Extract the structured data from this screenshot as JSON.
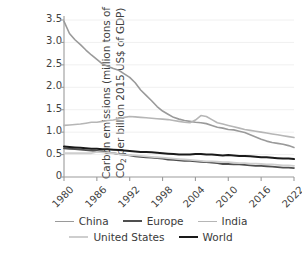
{
  "chart_data": {
    "type": "line",
    "title": "",
    "xlabel": "",
    "ylabel_line1": "Carbon emissions (million tons of",
    "ylabel_line2_a": "CO",
    "ylabel_line2_sub": "2",
    "ylabel_line2_b": " per billion 2015 US$ of GDP)",
    "ylabel_full": "Carbon emissions (million tons of CO2 per billion 2015 US$ of GDP)",
    "xlim": [
      1980,
      2022
    ],
    "ylim": [
      0,
      3.5
    ],
    "ytick_labels": [
      "3.5",
      "3.0",
      "2.5",
      "2.0",
      "1.5",
      "1.0",
      "0.5",
      "0"
    ],
    "ytick_values": [
      3.5,
      3.0,
      2.5,
      2.0,
      1.5,
      1.0,
      0.5,
      0
    ],
    "xtick_labels": [
      "1980",
      "1986",
      "1992",
      "1998",
      "2004",
      "2010",
      "2016",
      "2022"
    ],
    "xtick_values": [
      1980,
      1986,
      1992,
      1998,
      2004,
      2010,
      2016,
      2022
    ],
    "xtick_rotation": -45,
    "grid": "horizontal-light",
    "legend_position": "bottom",
    "x": [
      1980,
      1981,
      1982,
      1983,
      1984,
      1985,
      1986,
      1987,
      1988,
      1989,
      1990,
      1991,
      1992,
      1993,
      1994,
      1995,
      1996,
      1997,
      1998,
      1999,
      2000,
      2001,
      2002,
      2003,
      2004,
      2005,
      2006,
      2007,
      2008,
      2009,
      2010,
      2011,
      2012,
      2013,
      2014,
      2015,
      2016,
      2017,
      2018,
      2019,
      2020,
      2021,
      2022
    ],
    "series": [
      {
        "name": "China",
        "color": "#9a9a9a",
        "width": 1.6,
        "values": [
          3.47,
          3.2,
          3.06,
          2.95,
          2.83,
          2.72,
          2.62,
          2.52,
          2.47,
          2.42,
          2.38,
          2.3,
          2.22,
          2.1,
          1.94,
          1.82,
          1.7,
          1.57,
          1.47,
          1.4,
          1.33,
          1.29,
          1.26,
          1.24,
          1.22,
          1.21,
          1.19,
          1.15,
          1.11,
          1.09,
          1.06,
          1.05,
          1.02,
          0.99,
          0.94,
          0.89,
          0.84,
          0.8,
          0.77,
          0.75,
          0.73,
          0.7,
          0.66
        ]
      },
      {
        "name": "Europe",
        "color": "#4f4f4f",
        "width": 1.8,
        "values": [
          0.64,
          0.63,
          0.62,
          0.61,
          0.6,
          0.59,
          0.58,
          0.57,
          0.55,
          0.53,
          0.51,
          0.5,
          0.48,
          0.46,
          0.45,
          0.44,
          0.43,
          0.42,
          0.41,
          0.39,
          0.38,
          0.37,
          0.36,
          0.36,
          0.35,
          0.34,
          0.33,
          0.32,
          0.31,
          0.29,
          0.29,
          0.28,
          0.28,
          0.27,
          0.26,
          0.25,
          0.25,
          0.24,
          0.23,
          0.22,
          0.21,
          0.21,
          0.2
        ]
      },
      {
        "name": "India",
        "color": "#b6b6b6",
        "width": 1.6,
        "values": [
          1.15,
          1.16,
          1.17,
          1.18,
          1.2,
          1.22,
          1.22,
          1.24,
          1.26,
          1.27,
          1.3,
          1.33,
          1.35,
          1.34,
          1.33,
          1.32,
          1.31,
          1.3,
          1.29,
          1.28,
          1.26,
          1.24,
          1.22,
          1.21,
          1.27,
          1.37,
          1.35,
          1.28,
          1.21,
          1.18,
          1.15,
          1.12,
          1.09,
          1.06,
          1.04,
          1.02,
          1.0,
          0.98,
          0.96,
          0.94,
          0.92,
          0.9,
          0.88
        ]
      },
      {
        "name": "United States",
        "color": "#cecece",
        "width": 1.8,
        "values": [
          0.53,
          0.53,
          0.53,
          0.53,
          0.53,
          0.53,
          0.56,
          0.55,
          0.54,
          0.53,
          0.51,
          0.5,
          0.49,
          0.48,
          0.47,
          0.46,
          0.45,
          0.44,
          0.43,
          0.42,
          0.41,
          0.4,
          0.39,
          0.38,
          0.37,
          0.36,
          0.35,
          0.35,
          0.34,
          0.33,
          0.33,
          0.32,
          0.31,
          0.31,
          0.3,
          0.3,
          0.29,
          0.28,
          0.28,
          0.27,
          0.26,
          0.26,
          0.25
        ]
      },
      {
        "name": "World",
        "color": "#1a1a1a",
        "width": 2.0,
        "values": [
          0.68,
          0.67,
          0.66,
          0.65,
          0.64,
          0.63,
          0.63,
          0.62,
          0.62,
          0.61,
          0.6,
          0.59,
          0.58,
          0.57,
          0.56,
          0.56,
          0.55,
          0.54,
          0.53,
          0.52,
          0.51,
          0.5,
          0.5,
          0.5,
          0.51,
          0.51,
          0.5,
          0.5,
          0.49,
          0.48,
          0.49,
          0.48,
          0.47,
          0.47,
          0.46,
          0.45,
          0.44,
          0.44,
          0.43,
          0.42,
          0.41,
          0.41,
          0.4
        ]
      }
    ]
  },
  "legend": {
    "row1": [
      {
        "label": "China",
        "color": "#9a9a9a",
        "width": 1.6
      },
      {
        "label": "Europe",
        "color": "#4f4f4f",
        "width": 2.0
      },
      {
        "label": "India",
        "color": "#b6b6b6",
        "width": 1.6
      }
    ],
    "row2": [
      {
        "label": "United States",
        "color": "#cecece",
        "width": 2.0
      },
      {
        "label": "World",
        "color": "#1a1a1a",
        "width": 2.4
      }
    ]
  },
  "colors": {
    "background": "#ffffff",
    "axis": "#9b9b9b",
    "text": "#3a3a3a",
    "grid": "#f0f0f0"
  }
}
